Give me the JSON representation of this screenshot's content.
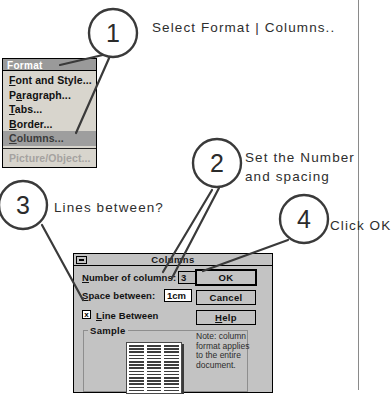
{
  "figure": {
    "callouts": [
      {
        "number": "1",
        "text": "Select Format | Columns.."
      },
      {
        "number": "2",
        "text_line1": "Set the Number",
        "text_line2": "and spacing"
      },
      {
        "number": "3",
        "text": "Lines between?"
      },
      {
        "number": "4",
        "text": "Click OK"
      }
    ]
  },
  "menu": {
    "title": "Format",
    "items": [
      {
        "label": "Font and Style...",
        "accel": "F",
        "state": "normal"
      },
      {
        "label": "Paragraph...",
        "accel": "a",
        "state": "normal"
      },
      {
        "label": "Tabs...",
        "accel": "T",
        "state": "normal"
      },
      {
        "label": "Border...",
        "accel": "B",
        "state": "normal"
      },
      {
        "label": "Columns...",
        "accel": "C",
        "state": "selected"
      },
      {
        "label": "Picture/Object...",
        "accel": "P",
        "state": "disabled"
      }
    ]
  },
  "dialog": {
    "title": "Columns",
    "system_menu_icon": "window-system-menu-icon",
    "fields": {
      "number_of_columns": {
        "label": "Number of columns:",
        "accel": "N",
        "value": "3"
      },
      "space_between": {
        "label": "Space between:",
        "accel": "S",
        "value": "1cm"
      },
      "line_between": {
        "label": "Line Between",
        "accel": "L",
        "checked": true,
        "check_glyph": "x"
      }
    },
    "sample": {
      "legend": "Sample",
      "columns": 3
    },
    "buttons": [
      {
        "label": "OK",
        "accel": "",
        "default": true
      },
      {
        "label": "Cancel",
        "accel": "",
        "default": false
      },
      {
        "label": "Help",
        "accel": "H",
        "default": false
      }
    ],
    "note": "Note: column format applies to the entire document."
  },
  "colors": {
    "dialog_face": "#c3c3c3",
    "menu_face": "#d8d5cd",
    "menu_title_bar": "#9a9a9a",
    "menu_selected": "#9e9e9e",
    "ink": "#2b2b2b",
    "page_rule": "#8a8a8a"
  }
}
